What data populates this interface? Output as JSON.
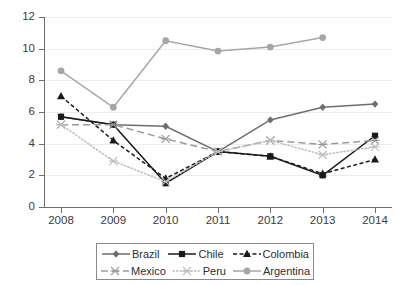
{
  "chart_data": {
    "type": "line",
    "title": "",
    "xlabel": "",
    "ylabel": "",
    "x": [
      "2008",
      "2009",
      "2010",
      "2011",
      "2012",
      "2013",
      "2014"
    ],
    "categories": [
      "2008",
      "2009",
      "2010",
      "2011",
      "2012",
      "2013",
      "2014"
    ],
    "ylim": [
      0,
      12
    ],
    "yticks": [
      0,
      2,
      4,
      6,
      8,
      10,
      12
    ],
    "ytick_labels": [
      "0",
      "2",
      "4",
      "6",
      "8",
      "10",
      "12"
    ],
    "grid": true,
    "grid_axis": "y",
    "legend_position": "bottom",
    "series": [
      {
        "name": "Brazil",
        "color": "#6e6e6e",
        "marker": "diamond",
        "line_style": "solid",
        "values": [
          5.7,
          5.2,
          5.1,
          3.5,
          5.5,
          6.3,
          6.5
        ]
      },
      {
        "name": "Chile",
        "color": "#1a1a1a",
        "marker": "square",
        "line_style": "solid",
        "values": [
          5.7,
          5.2,
          1.5,
          3.5,
          3.2,
          2.0,
          4.5
        ]
      },
      {
        "name": "Colombia",
        "color": "#1a1a1a",
        "marker": "triangle",
        "line_style": "dashed",
        "values": [
          7.0,
          4.2,
          1.8,
          3.5,
          3.2,
          2.1,
          3.0
        ]
      },
      {
        "name": "Mexico",
        "color": "#9a9a9a",
        "marker": "x",
        "line_style": "long-dash",
        "values": [
          5.2,
          5.2,
          4.3,
          3.5,
          4.2,
          3.95,
          4.2
        ]
      },
      {
        "name": "Peru",
        "color": "#bdbdbd",
        "marker": "x",
        "line_style": "dotted",
        "values": [
          5.2,
          2.9,
          1.6,
          3.5,
          4.2,
          3.3,
          3.8
        ]
      },
      {
        "name": "Argentina",
        "color": "#a6a6a6",
        "marker": "circle",
        "line_style": "solid",
        "values": [
          8.6,
          6.3,
          10.5,
          9.85,
          10.1,
          10.7,
          null
        ]
      }
    ]
  },
  "legend": {
    "rows": [
      [
        "Brazil",
        "Chile",
        "Colombia"
      ],
      [
        "Mexico",
        "Peru",
        "Argentina"
      ]
    ]
  },
  "colors": {
    "axis": "#6e6e6e",
    "grid": "#ececec",
    "text": "#3c3c3c",
    "background": "#ffffff"
  }
}
